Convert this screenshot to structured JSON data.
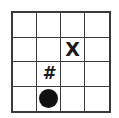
{
  "board": {
    "rows": 4,
    "cols": 4,
    "grid_color": "#3a3a3a",
    "cells": [
      [
        "",
        "",
        "",
        ""
      ],
      [
        "",
        "",
        "X",
        ""
      ],
      [
        "",
        "#",
        "",
        ""
      ],
      [
        "",
        "circle",
        "",
        ""
      ]
    ]
  },
  "pieces": {
    "x": {
      "label": "X",
      "row": 1,
      "col": 2
    },
    "hash": {
      "label": "#",
      "row": 2,
      "col": 1
    },
    "circle": {
      "icon": "filled-circle-icon",
      "row": 3,
      "col": 1,
      "color": "#111111"
    }
  }
}
